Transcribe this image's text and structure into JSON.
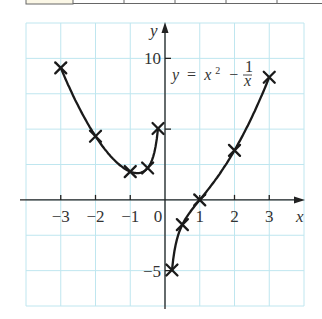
{
  "chart_data": {
    "type": "line",
    "title": "",
    "equation": {
      "lhs": "y",
      "eq": "=",
      "term1": "x",
      "exp": "2",
      "minus": "−",
      "frac_num": "1",
      "frac_den": "x"
    },
    "xlabel": "x",
    "ylabel": "y",
    "xlim": [
      -4,
      4
    ],
    "ylim": [
      -7.5,
      12.5
    ],
    "grid": true,
    "grid_step": {
      "x": 1,
      "y": 2.5
    },
    "x_ticks": [
      -3,
      -2,
      -1,
      0,
      1,
      2,
      3
    ],
    "x_tick_labels": [
      "−3",
      "−2",
      "−1",
      "0",
      "1",
      "2",
      "3"
    ],
    "y_ticks": [
      10,
      5,
      -5
    ],
    "y_tick_labels": [
      "10",
      "",
      "−5"
    ],
    "series": [
      {
        "name": "left branch (x<0)",
        "points": [
          [
            -3,
            9.33
          ],
          [
            -2,
            4.5
          ],
          [
            -1,
            2
          ],
          [
            -0.5,
            2.25
          ],
          [
            -0.2,
            5.04
          ]
        ]
      },
      {
        "name": "right branch (x>0)",
        "points": [
          [
            0.2,
            -4.96
          ],
          [
            0.5,
            -1.75
          ],
          [
            1,
            0
          ],
          [
            2,
            3.5
          ],
          [
            3,
            8.67
          ]
        ]
      }
    ],
    "colors": {
      "grid": "#bfe6ef",
      "curve": "#1a1a1a",
      "axis": "#222222",
      "table_fill": "#fbf7e6"
    }
  }
}
